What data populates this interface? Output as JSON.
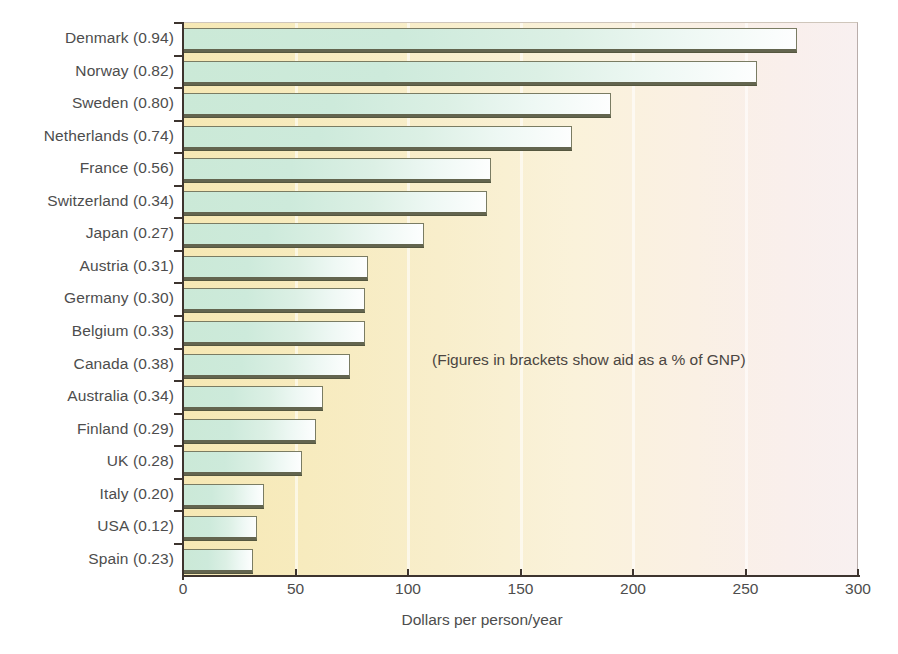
{
  "chart_data": {
    "type": "bar",
    "orientation": "horizontal",
    "title": "",
    "subtitle": "",
    "xlabel": "Dollars per person/year",
    "ylabel": "",
    "xlim": [
      0,
      300
    ],
    "xticks": [
      0,
      50,
      100,
      150,
      200,
      250,
      300
    ],
    "xtick_labels": [
      "0",
      "50",
      "100",
      "150",
      "200",
      "250",
      "300"
    ],
    "grid": "vertical-minor-white",
    "legend": "none",
    "annotations": [
      "(Figures in brackets show aid as a % of GNP)"
    ],
    "categories": [
      "Denmark (0.94)",
      "Norway (0.82)",
      "Sweden (0.80)",
      "Netherlands (0.74)",
      "France (0.56)",
      "Switzerland (0.34)",
      "Japan (0.27)",
      "Austria (0.31)",
      "Germany (0.30)",
      "Belgium (0.33)",
      "Canada (0.38)",
      "Australia (0.34)",
      "Finland (0.29)",
      "UK (0.28)",
      "Italy (0.20)",
      "USA (0.12)",
      "Spain (0.23)"
    ],
    "values": [
      273,
      255,
      190,
      173,
      137,
      135,
      107,
      82,
      81,
      81,
      74,
      62,
      59,
      53,
      36,
      33,
      31
    ],
    "gnp_percent": [
      0.94,
      0.82,
      0.8,
      0.74,
      0.56,
      0.34,
      0.27,
      0.31,
      0.3,
      0.33,
      0.38,
      0.34,
      0.29,
      0.28,
      0.2,
      0.12,
      0.23
    ],
    "country_names": [
      "Denmark",
      "Norway",
      "Sweden",
      "Netherlands",
      "France",
      "Switzerland",
      "Japan",
      "Austria",
      "Germany",
      "Belgium",
      "Canada",
      "Australia",
      "Finland",
      "UK",
      "Italy",
      "USA",
      "Spain"
    ],
    "colors": {
      "bar_fill_start": "#cbe9d7",
      "bar_fill_end": "#fdfefe",
      "bar_border": "#7a7c63",
      "bar_shadow": "#55573f",
      "plot_bg_start": "#f6e8b4",
      "plot_bg_end": "#f8f0f0",
      "axis": "#3d342e",
      "text": "#4d4d4d"
    }
  }
}
